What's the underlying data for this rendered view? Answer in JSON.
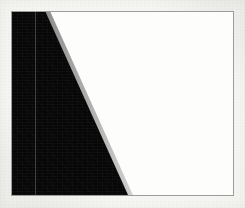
{
  "figure": {
    "canvas": {
      "width_px": 245,
      "height_px": 208
    },
    "colors": {
      "sheet_background": "#f8f8f6",
      "frame_border": "#9b9b99",
      "frame_interior": "#fdfdfc",
      "wedge_fill": "#070707",
      "interior_rule": "#969696"
    },
    "frame": {
      "name": "plot-frame",
      "left_px": 11,
      "top_px": 11,
      "width_px": 223,
      "height_px": 185,
      "border_width_px": 1
    },
    "wedge": {
      "name": "black-wedge",
      "shape": "quadrilateral",
      "vertices_percent": [
        {
          "x": 0.0,
          "y": 0.0
        },
        {
          "x": 15.2,
          "y": 0.0
        },
        {
          "x": 52.5,
          "y": 100.0
        },
        {
          "x": 0.0,
          "y": 100.0
        }
      ],
      "top_edge_width_percent": 15.2,
      "bottom_edge_width_percent": 52.5,
      "diagonal": {
        "from_percent": {
          "x": 15.2,
          "y": 0.0
        },
        "to_percent": {
          "x": 52.5,
          "y": 100.0
        },
        "direction": "top-left to bottom-right"
      }
    },
    "interior_rule": {
      "name": "vertical-rule",
      "orientation": "vertical",
      "x_percent": 10.3,
      "width_px": 1,
      "spans_full_height": true
    }
  }
}
